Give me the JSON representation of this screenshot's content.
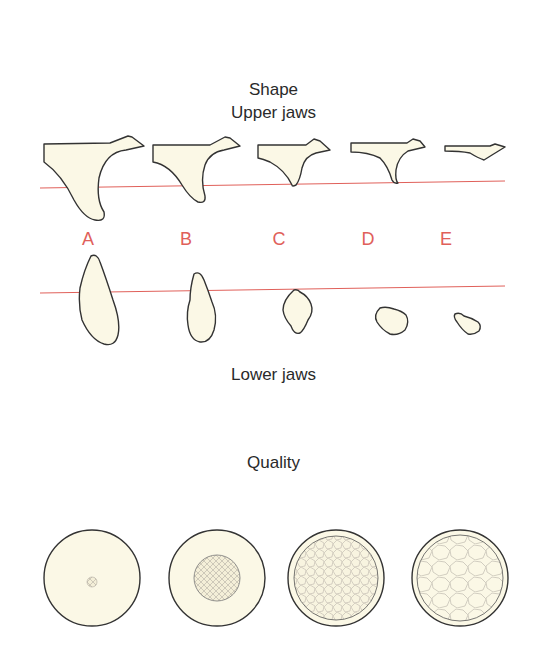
{
  "titles": {
    "shape": "Shape",
    "upper": "Upper jaws",
    "lower": "Lower jaws",
    "quality": "Quality"
  },
  "classes": [
    {
      "label": "A",
      "x": 88
    },
    {
      "label": "B",
      "x": 186
    },
    {
      "label": "C",
      "x": 279
    },
    {
      "label": "D",
      "x": 368
    },
    {
      "label": "E",
      "x": 446
    }
  ],
  "colors": {
    "bone_fill": "#fbf8e6",
    "outline": "#333333",
    "reference_line": "#e0605a",
    "label": "#e0605a"
  },
  "quality_grades": [
    {
      "grade": 1,
      "description": "homogeneous compact bone"
    },
    {
      "grade": 2,
      "description": "thick cortex around dense trabecular core"
    },
    {
      "grade": 3,
      "description": "thin cortex around dense trabecular core"
    },
    {
      "grade": 4,
      "description": "thin cortex around low-density trabecular core"
    }
  ]
}
